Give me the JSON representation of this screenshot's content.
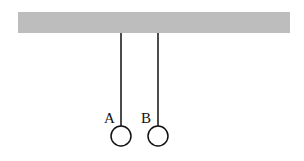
{
  "diagram": {
    "ceiling": {
      "x": 18,
      "y": 12,
      "width": 272,
      "height": 21,
      "color": "#bdbdbd"
    },
    "pendulums": [
      {
        "label": "A",
        "x": 121,
        "top": 33,
        "bottom": 126,
        "cy": 136,
        "r": 10,
        "label_x": 104,
        "label_y": 122
      },
      {
        "label": "B",
        "x": 158,
        "top": 33,
        "bottom": 126,
        "cy": 136,
        "r": 10,
        "label_x": 141,
        "label_y": 122
      }
    ]
  }
}
